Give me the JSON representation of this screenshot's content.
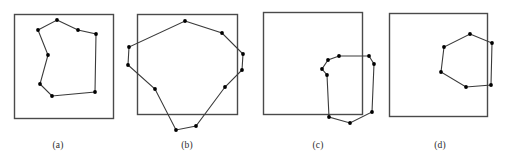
{
  "figure": {
    "width": 507,
    "height": 168,
    "background_color": "#ffffff",
    "stroke_color": "#3a3a3a",
    "box_stroke_color": "#4a4a4a",
    "vertex_color": "#000000",
    "panel_count": 4
  },
  "captions": {
    "a": "(a)",
    "b": "(b)",
    "c": "(c)",
    "d": "(d)"
  },
  "chart_data": {
    "type": "diagram",
    "title": "",
    "xlabel": "",
    "ylabel": "",
    "panels": [
      {
        "id": "a",
        "caption": "(a)",
        "box": {
          "x": 14,
          "y": 14,
          "width": 99,
          "height": 104
        },
        "polygon_closed": true,
        "relation": "polygon fully inside box",
        "vertices": [
          [
            57,
            20
          ],
          [
            78,
            30
          ],
          [
            96,
            34
          ],
          [
            95,
            92
          ],
          [
            52,
            96
          ],
          [
            40,
            84
          ],
          [
            48,
            55
          ],
          [
            38,
            30
          ]
        ]
      },
      {
        "id": "b",
        "caption": "(b)",
        "box": {
          "x": 137,
          "y": 14,
          "width": 100,
          "height": 100
        },
        "polygon_closed": true,
        "relation": "polygon overlaps box, extends past left, right and bottom edges",
        "vertices": [
          [
            185,
            21
          ],
          [
            222,
            33
          ],
          [
            243,
            54
          ],
          [
            242,
            70
          ],
          [
            225,
            87
          ],
          [
            196,
            126
          ],
          [
            176,
            130
          ],
          [
            155,
            89
          ],
          [
            128,
            65
          ],
          [
            129,
            47
          ]
        ]
      },
      {
        "id": "c",
        "caption": "(c)",
        "box": {
          "x": 263,
          "y": 12,
          "width": 99,
          "height": 102
        },
        "polygon_closed": true,
        "relation": "small polygon straddles the bottom-right corner of the box",
        "vertices": [
          [
            339,
            56
          ],
          [
            369,
            56
          ],
          [
            374,
            64
          ],
          [
            372,
            112
          ],
          [
            350,
            123
          ],
          [
            329,
            117
          ],
          [
            327,
            75
          ],
          [
            322,
            69
          ],
          [
            328,
            60
          ]
        ]
      },
      {
        "id": "d",
        "caption": "(d)",
        "box": {
          "x": 389,
          "y": 13,
          "width": 98,
          "height": 103
        },
        "polygon_closed": true,
        "relation": "polygon inside box but crosses the right edge",
        "vertices": [
          [
            470,
            34
          ],
          [
            492,
            43
          ],
          [
            491,
            85
          ],
          [
            466,
            87
          ],
          [
            441,
            72
          ],
          [
            444,
            47
          ]
        ]
      }
    ]
  }
}
